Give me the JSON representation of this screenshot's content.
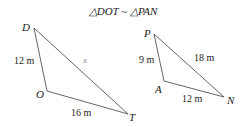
{
  "title": "△DOT ~ △PAN",
  "triangle_dot": {
    "vertices": {
      "D": "D",
      "O": "O",
      "T": "T"
    },
    "sides": {
      "DO": "12 m",
      "OT": "16 m",
      "DT": "x"
    }
  },
  "triangle_pan": {
    "vertices": {
      "P": "P",
      "A": "A",
      "N": "N"
    },
    "sides": {
      "PA": "9 m",
      "AN": "12 m",
      "PN": "18 m"
    }
  },
  "colors": {
    "line": "#555555",
    "text": "#222222"
  }
}
